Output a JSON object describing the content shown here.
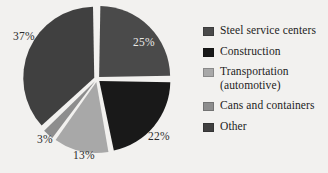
{
  "chart_data": {
    "type": "pie",
    "title": "",
    "categories": [
      "Steel service centers",
      "Construction",
      "Transportation (automotive)",
      "Cans and containers",
      "Other"
    ],
    "values": [
      25,
      22,
      13,
      3,
      37
    ],
    "value_labels": [
      "25%",
      "22%",
      "13%",
      "3%",
      "37%"
    ],
    "colors": [
      "#4a4a4a",
      "#191919",
      "#a8a8a8",
      "#8d8d8d",
      "#404040"
    ],
    "legend_position": "right",
    "grid": false,
    "exploded": true,
    "background_color": "#f2f1ef"
  },
  "legend": {
    "items": [
      {
        "label": "Steel service centers",
        "label_line2": "",
        "color": "#4a4a4a"
      },
      {
        "label": "Construction",
        "label_line2": "",
        "color": "#191919"
      },
      {
        "label": "Transportation",
        "label_line2": "(automotive)",
        "color": "#a8a8a8"
      },
      {
        "label": "Cans and containers",
        "label_line2": "",
        "color": "#8d8d8d"
      },
      {
        "label": "Other",
        "label_line2": "",
        "color": "#404040"
      }
    ]
  },
  "pie_labels": {
    "steel": "25%",
    "construction": "22%",
    "transportation": "13%",
    "cans": "3%",
    "other": "37%"
  }
}
